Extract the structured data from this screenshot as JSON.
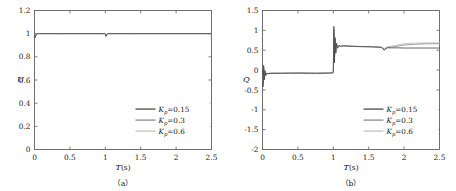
{
  "figure": {
    "background_color": "#ffffff",
    "panel_count": 2
  },
  "series_styles": {
    "kp015_color": "#4a4a4a",
    "kp03_color": "#8c8c8c",
    "kp06_color": "#c2c2c2",
    "axis_color": "#6f6f6f"
  },
  "legend": {
    "entries": [
      {
        "label_prefix": "K",
        "label_sub": "p",
        "label_value": "=0.15",
        "full": "Kp=0.15",
        "color": "#4a4a4a"
      },
      {
        "label_prefix": "K",
        "label_sub": "p",
        "label_value": "=0.3",
        "full": "Kp=0.3",
        "color": "#8c8c8c"
      },
      {
        "label_prefix": "K",
        "label_sub": "p",
        "label_value": "=0.6",
        "full": "Kp=0.6",
        "color": "#c2c2c2"
      }
    ]
  },
  "chart_data": [
    {
      "panel_id": "a",
      "caption": "（a）",
      "type": "line",
      "title": "",
      "xlabel": "T",
      "xlabel_units": "(s)",
      "ylabel": "U",
      "ylabel_units": "",
      "xlim": [
        0,
        2.5
      ],
      "ylim": [
        0,
        1.2
      ],
      "xticks": [
        0,
        0.5,
        1,
        1.5,
        2,
        2.5
      ],
      "xticklabels": [
        "0",
        "0.5",
        "1",
        "1.5",
        "2",
        "2.5"
      ],
      "yticks": [
        0,
        0.2,
        0.4,
        0.6,
        0.8,
        1,
        1.2
      ],
      "yticklabels": [
        "0",
        "0.2",
        "0.4",
        "0.6",
        "0.8",
        "1",
        "1.2"
      ],
      "grid": false,
      "legend_position": "lower-right",
      "series": [
        {
          "name": "Kp=0.15",
          "color": "#4a4a4a",
          "x": [
            0,
            0.01,
            0.02,
            0.035,
            0.05,
            0.07,
            0.1,
            0.2,
            0.4,
            0.6,
            0.8,
            0.97,
            0.99,
            1.0,
            1.01,
            1.02,
            1.035,
            1.05,
            1.08,
            1.15,
            1.4,
            1.7,
            2.0,
            2.25,
            2.5
          ],
          "y": [
            1.0,
            0.965,
            0.988,
            0.998,
            1.001,
            1.0,
            1.0,
            1.0,
            1.0,
            1.0,
            1.0,
            1.0,
            1.0,
            0.998,
            0.975,
            0.99,
            0.998,
            1.0,
            1.0,
            1.0,
            1.0,
            1.0,
            1.0,
            1.0,
            1.0
          ]
        },
        {
          "name": "Kp=0.3",
          "color": "#8c8c8c",
          "x": [
            0,
            0.01,
            0.02,
            0.035,
            0.05,
            0.07,
            0.1,
            0.2,
            0.4,
            0.6,
            0.8,
            0.97,
            0.99,
            1.0,
            1.01,
            1.02,
            1.035,
            1.05,
            1.08,
            1.15,
            1.4,
            1.7,
            2.0,
            2.25,
            2.5
          ],
          "y": [
            1.0,
            0.972,
            0.991,
            0.999,
            1.001,
            1.0,
            1.0,
            1.0,
            1.0,
            1.0,
            1.0,
            1.0,
            1.0,
            0.999,
            0.981,
            0.993,
            0.999,
            1.0,
            1.0,
            1.0,
            1.0,
            1.0,
            1.0,
            1.0,
            1.0
          ]
        },
        {
          "name": "Kp=0.6",
          "color": "#c2c2c2",
          "x": [
            0,
            0.01,
            0.02,
            0.035,
            0.05,
            0.07,
            0.1,
            0.2,
            0.4,
            0.6,
            0.8,
            0.97,
            0.99,
            1.0,
            1.01,
            1.02,
            1.035,
            1.05,
            1.08,
            1.15,
            1.4,
            1.7,
            2.0,
            2.25,
            2.5
          ],
          "y": [
            1.0,
            0.98,
            0.994,
            1.0,
            1.001,
            1.0,
            1.0,
            1.0,
            1.0,
            1.0,
            1.0,
            1.0,
            1.0,
            1.0,
            0.987,
            0.996,
            1.0,
            1.0,
            1.0,
            1.0,
            1.0,
            1.0,
            1.0,
            1.0,
            1.0
          ]
        }
      ]
    },
    {
      "panel_id": "b",
      "caption": "（b）",
      "type": "line",
      "title": "",
      "xlabel": "T",
      "xlabel_units": "(s)",
      "ylabel": "Q",
      "ylabel_units": "",
      "xlim": [
        0,
        2.5
      ],
      "ylim": [
        -2,
        1.5
      ],
      "xticks": [
        0,
        0.5,
        1,
        1.5,
        2,
        2.5
      ],
      "xticklabels": [
        "0",
        "0.5",
        "1",
        "1.5",
        "2",
        "2.5"
      ],
      "yticks": [
        -2,
        -1.5,
        -1,
        -0.5,
        0,
        0.5,
        1,
        1.5
      ],
      "yticklabels": [
        "-2",
        "-1.5",
        "-1",
        "-0.5",
        "0",
        "0.5",
        "1",
        "1.5"
      ],
      "grid": false,
      "legend_position": "lower-right",
      "series": [
        {
          "name": "Kp=0.15",
          "color": "#4a4a4a",
          "x": [
            0,
            0.008,
            0.016,
            0.025,
            0.035,
            0.045,
            0.06,
            0.08,
            0.12,
            0.25,
            0.5,
            0.75,
            0.95,
            0.99,
            1.0,
            1.008,
            1.016,
            1.025,
            1.035,
            1.045,
            1.06,
            1.08,
            1.1,
            1.15,
            1.25,
            1.4,
            1.55,
            1.68,
            1.72,
            1.76,
            1.82,
            1.9,
            2.0,
            2.15,
            2.3,
            2.5
          ],
          "y": [
            0.0,
            -0.42,
            0.12,
            -0.25,
            -0.02,
            -0.14,
            -0.08,
            -0.09,
            -0.08,
            -0.08,
            -0.075,
            -0.08,
            -0.075,
            -0.07,
            -0.06,
            1.1,
            0.18,
            0.82,
            0.42,
            0.68,
            0.55,
            0.62,
            0.6,
            0.61,
            0.6,
            0.59,
            0.585,
            0.57,
            0.5,
            0.56,
            0.56,
            0.56,
            0.555,
            0.555,
            0.555,
            0.555
          ]
        },
        {
          "name": "Kp=0.3",
          "color": "#8c8c8c",
          "x": [
            0,
            0.008,
            0.016,
            0.025,
            0.035,
            0.045,
            0.06,
            0.08,
            0.12,
            0.25,
            0.5,
            0.75,
            0.95,
            0.99,
            1.0,
            1.008,
            1.016,
            1.025,
            1.035,
            1.045,
            1.06,
            1.08,
            1.1,
            1.15,
            1.25,
            1.4,
            1.55,
            1.68,
            1.72,
            1.76,
            1.82,
            1.9,
            2.0,
            2.15,
            2.3,
            2.5
          ],
          "y": [
            0.0,
            -0.36,
            0.08,
            -0.22,
            -0.03,
            -0.13,
            -0.08,
            -0.09,
            -0.08,
            -0.08,
            -0.075,
            -0.08,
            -0.075,
            -0.07,
            -0.06,
            1.02,
            0.2,
            0.78,
            0.45,
            0.66,
            0.56,
            0.62,
            0.6,
            0.61,
            0.6,
            0.59,
            0.585,
            0.575,
            0.52,
            0.57,
            0.58,
            0.6,
            0.63,
            0.65,
            0.66,
            0.665
          ]
        },
        {
          "name": "Kp=0.6",
          "color": "#c2c2c2",
          "x": [
            0,
            0.008,
            0.016,
            0.025,
            0.035,
            0.045,
            0.06,
            0.08,
            0.12,
            0.25,
            0.5,
            0.75,
            0.95,
            0.99,
            1.0,
            1.008,
            1.016,
            1.025,
            1.035,
            1.045,
            1.06,
            1.08,
            1.1,
            1.15,
            1.25,
            1.4,
            1.55,
            1.68,
            1.72,
            1.76,
            1.82,
            1.9,
            2.0,
            2.15,
            2.3,
            2.5
          ],
          "y": [
            0.0,
            -0.3,
            0.05,
            -0.2,
            -0.04,
            -0.12,
            -0.08,
            -0.09,
            -0.08,
            -0.08,
            -0.075,
            -0.08,
            -0.075,
            -0.07,
            -0.06,
            0.95,
            0.24,
            0.75,
            0.48,
            0.65,
            0.57,
            0.62,
            0.6,
            0.61,
            0.6,
            0.595,
            0.59,
            0.58,
            0.54,
            0.58,
            0.6,
            0.63,
            0.665,
            0.68,
            0.685,
            0.685
          ]
        }
      ]
    }
  ]
}
